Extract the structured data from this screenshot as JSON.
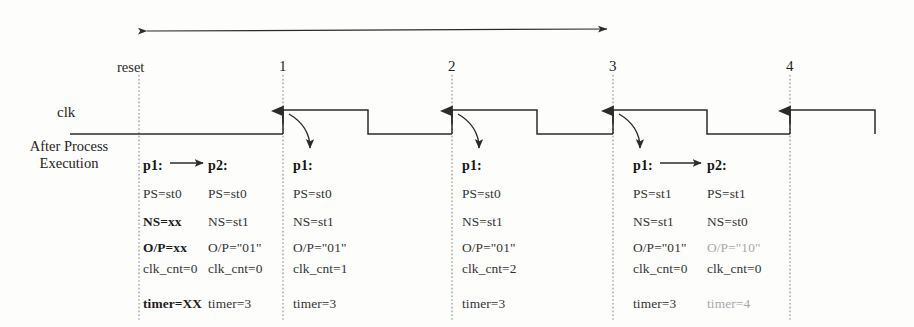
{
  "diagram": {
    "clk_label": "clk",
    "after_process_label": "After Process Execution",
    "reset_label": "reset",
    "ink_color": "#2b2b2b",
    "faded_color": "#a9a9a9",
    "markers": [
      {
        "name": "1",
        "x": 283
      },
      {
        "name": "2",
        "x": 452
      },
      {
        "name": "3",
        "x": 613
      },
      {
        "name": "4",
        "x": 790
      }
    ],
    "span_arrow": {
      "from_label": "1",
      "to_label": "3",
      "style": "double-headed"
    },
    "columns": [
      {
        "id": "col-reset-p1",
        "process": "p1:",
        "arrow_to_next": true,
        "x": 143,
        "rows": [
          {
            "key": "PS",
            "text": "PS=st0",
            "bold": false,
            "faded": false
          },
          {
            "key": "NS",
            "text": "NS=xx",
            "bold": true,
            "faded": false
          },
          {
            "key": "OP",
            "text": "O/P=xx",
            "bold": true,
            "faded": false
          },
          {
            "key": "clk_cnt",
            "text": "clk_cnt=0",
            "bold": false,
            "faded": false
          },
          {
            "key": "timer",
            "text": "timer=XX",
            "bold": true,
            "faded": false
          }
        ]
      },
      {
        "id": "col-reset-p2",
        "process": "p2:",
        "arrow_to_next": false,
        "x": 208,
        "rows": [
          {
            "key": "PS",
            "text": "PS=st0",
            "bold": false,
            "faded": false
          },
          {
            "key": "NS",
            "text": "NS=st1",
            "bold": false,
            "faded": false
          },
          {
            "key": "OP",
            "text": "O/P=\"01\"",
            "bold": false,
            "faded": false
          },
          {
            "key": "clk_cnt",
            "text": "clk_cnt=0",
            "bold": false,
            "faded": false
          },
          {
            "key": "timer",
            "text": "timer=3",
            "bold": false,
            "faded": false
          }
        ]
      },
      {
        "id": "col-edge1-p1",
        "process": "p1:",
        "arrow_to_next": false,
        "x": 293,
        "rows": [
          {
            "key": "PS",
            "text": "PS=st0",
            "bold": false,
            "faded": false
          },
          {
            "key": "NS",
            "text": "NS=st1",
            "bold": false,
            "faded": false
          },
          {
            "key": "OP",
            "text": "O/P=\"01\"",
            "bold": false,
            "faded": false
          },
          {
            "key": "clk_cnt",
            "text": "clk_cnt=1",
            "bold": false,
            "faded": false
          },
          {
            "key": "timer",
            "text": "timer=3",
            "bold": false,
            "faded": false
          }
        ]
      },
      {
        "id": "col-edge2-p1",
        "process": "p1:",
        "arrow_to_next": false,
        "x": 462,
        "rows": [
          {
            "key": "PS",
            "text": "PS=st0",
            "bold": false,
            "faded": false
          },
          {
            "key": "NS",
            "text": "NS=st1",
            "bold": false,
            "faded": false
          },
          {
            "key": "OP",
            "text": "O/P=\"01\"",
            "bold": false,
            "faded": false
          },
          {
            "key": "clk_cnt",
            "text": "clk_cnt=2",
            "bold": false,
            "faded": false
          },
          {
            "key": "timer",
            "text": "timer=3",
            "bold": false,
            "faded": false
          }
        ]
      },
      {
        "id": "col-edge3-p1",
        "process": "p1:",
        "arrow_to_next": true,
        "x": 633,
        "rows": [
          {
            "key": "PS",
            "text": "PS=st1",
            "bold": false,
            "faded": false
          },
          {
            "key": "NS",
            "text": "NS=st1",
            "bold": false,
            "faded": false
          },
          {
            "key": "OP",
            "text": "O/P=\"01\"",
            "bold": false,
            "faded": false
          },
          {
            "key": "clk_cnt",
            "text": "clk_cnt=0",
            "bold": false,
            "faded": false
          },
          {
            "key": "timer",
            "text": "timer=3",
            "bold": false,
            "faded": false
          }
        ]
      },
      {
        "id": "col-edge3-p2",
        "process": "p2:",
        "arrow_to_next": false,
        "x": 707,
        "rows": [
          {
            "key": "PS",
            "text": "PS=st1",
            "bold": false,
            "faded": false
          },
          {
            "key": "NS",
            "text": "NS=st0",
            "bold": false,
            "faded": false
          },
          {
            "key": "OP",
            "text": "O/P=\"10\"",
            "bold": false,
            "faded": true
          },
          {
            "key": "clk_cnt",
            "text": "clk_cnt=0",
            "bold": false,
            "faded": false
          },
          {
            "key": "timer",
            "text": "timer=4",
            "bold": false,
            "faded": true
          }
        ]
      }
    ],
    "row_y": {
      "process": 158,
      "PS": 186,
      "NS": 214,
      "OP": 240,
      "clk_cnt": 261,
      "timer": 296
    },
    "waveform": {
      "signal": "clk",
      "low_y": 134,
      "high_y": 109,
      "start_x": 70,
      "end_x": 900,
      "rising_edges": [
        283,
        452,
        613,
        790
      ],
      "falling_edges": [
        368,
        537,
        707,
        875
      ]
    }
  }
}
